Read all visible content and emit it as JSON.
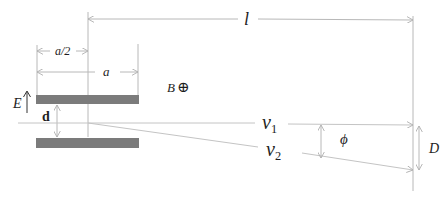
{
  "diagram": {
    "colors": {
      "background": "#ffffff",
      "plate": "#7b7b7b",
      "line": "#b8b8b8",
      "text": "#1e1e1e"
    },
    "labels": {
      "length_l": "l",
      "half_plate": "a/2",
      "plate_length": "a",
      "magnetic_field": "B",
      "magnetic_field_symbol": "⊕",
      "electric_field": "E",
      "plate_gap": "d",
      "v1_base": "v",
      "v1_sub": "1",
      "v2_base": "v",
      "v2_sub": "2",
      "angle": "ϕ",
      "deflection": "D"
    },
    "elements": {
      "top_plate": {
        "x": 36,
        "y": 95,
        "w": 103,
        "h": 9
      },
      "bottom_plate": {
        "x": 36,
        "y": 138,
        "w": 103,
        "h": 10
      },
      "center_line_x": 88,
      "screen_x": 413
    }
  }
}
